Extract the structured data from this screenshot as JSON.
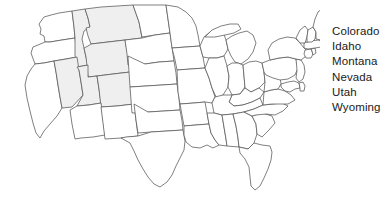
{
  "page": {
    "background_color": "#ffffff",
    "width": 388,
    "height": 200
  },
  "map": {
    "name": "united-states-map",
    "region": "Contiguous United States",
    "outline_color": "#555555",
    "default_fill": "#ffffff",
    "highlight_fill": "#efefef",
    "highlighted_states": [
      "Colorado",
      "Idaho",
      "Montana",
      "Nevada",
      "Utah",
      "Wyoming"
    ],
    "states": [
      {
        "code": "WA",
        "name": "Washington",
        "highlighted": false
      },
      {
        "code": "OR",
        "name": "Oregon",
        "highlighted": false
      },
      {
        "code": "CA",
        "name": "California",
        "highlighted": false
      },
      {
        "code": "ID",
        "name": "Idaho",
        "highlighted": true
      },
      {
        "code": "NV",
        "name": "Nevada",
        "highlighted": true
      },
      {
        "code": "MT",
        "name": "Montana",
        "highlighted": true
      },
      {
        "code": "WY",
        "name": "Wyoming",
        "highlighted": true
      },
      {
        "code": "UT",
        "name": "Utah",
        "highlighted": true
      },
      {
        "code": "CO",
        "name": "Colorado",
        "highlighted": true
      },
      {
        "code": "AZ",
        "name": "Arizona",
        "highlighted": false
      },
      {
        "code": "NM",
        "name": "New Mexico",
        "highlighted": false
      },
      {
        "code": "ND",
        "name": "North Dakota",
        "highlighted": false
      },
      {
        "code": "SD",
        "name": "South Dakota",
        "highlighted": false
      },
      {
        "code": "NE",
        "name": "Nebraska",
        "highlighted": false
      },
      {
        "code": "KS",
        "name": "Kansas",
        "highlighted": false
      },
      {
        "code": "OK",
        "name": "Oklahoma",
        "highlighted": false
      },
      {
        "code": "TX",
        "name": "Texas",
        "highlighted": false
      },
      {
        "code": "MN",
        "name": "Minnesota",
        "highlighted": false
      },
      {
        "code": "IA",
        "name": "Iowa",
        "highlighted": false
      },
      {
        "code": "MO",
        "name": "Missouri",
        "highlighted": false
      },
      {
        "code": "AR",
        "name": "Arkansas",
        "highlighted": false
      },
      {
        "code": "LA",
        "name": "Louisiana",
        "highlighted": false
      },
      {
        "code": "WI",
        "name": "Wisconsin",
        "highlighted": false
      },
      {
        "code": "IL",
        "name": "Illinois",
        "highlighted": false
      },
      {
        "code": "MI",
        "name": "Michigan",
        "highlighted": false
      },
      {
        "code": "IN",
        "name": "Indiana",
        "highlighted": false
      },
      {
        "code": "OH",
        "name": "Ohio",
        "highlighted": false
      },
      {
        "code": "KY",
        "name": "Kentucky",
        "highlighted": false
      },
      {
        "code": "TN",
        "name": "Tennessee",
        "highlighted": false
      },
      {
        "code": "MS",
        "name": "Mississippi",
        "highlighted": false
      },
      {
        "code": "AL",
        "name": "Alabama",
        "highlighted": false
      },
      {
        "code": "GA",
        "name": "Georgia",
        "highlighted": false
      },
      {
        "code": "FL",
        "name": "Florida",
        "highlighted": false
      },
      {
        "code": "SC",
        "name": "South Carolina",
        "highlighted": false
      },
      {
        "code": "NC",
        "name": "North Carolina",
        "highlighted": false
      },
      {
        "code": "VA",
        "name": "Virginia",
        "highlighted": false
      },
      {
        "code": "WV",
        "name": "West Virginia",
        "highlighted": false
      },
      {
        "code": "MD",
        "name": "Maryland",
        "highlighted": false
      },
      {
        "code": "DE",
        "name": "Delaware",
        "highlighted": false
      },
      {
        "code": "PA",
        "name": "Pennsylvania",
        "highlighted": false
      },
      {
        "code": "NJ",
        "name": "New Jersey",
        "highlighted": false
      },
      {
        "code": "NY",
        "name": "New York",
        "highlighted": false
      },
      {
        "code": "CT",
        "name": "Connecticut",
        "highlighted": false
      },
      {
        "code": "RI",
        "name": "Rhode Island",
        "highlighted": false
      },
      {
        "code": "MA",
        "name": "Massachusetts",
        "highlighted": false
      },
      {
        "code": "VT",
        "name": "Vermont",
        "highlighted": false
      },
      {
        "code": "NH",
        "name": "New Hampshire",
        "highlighted": false
      },
      {
        "code": "ME",
        "name": "Maine",
        "highlighted": false
      }
    ]
  },
  "legend": {
    "name": "state-name-list",
    "text_color": "#1a1a1a",
    "items": [
      {
        "label": "Colorado"
      },
      {
        "label": "Idaho"
      },
      {
        "label": "Montana"
      },
      {
        "label": "Nevada"
      },
      {
        "label": "Utah"
      },
      {
        "label": "Wyoming"
      }
    ]
  }
}
